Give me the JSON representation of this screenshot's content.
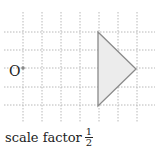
{
  "diagram": {
    "grid": {
      "vertical_x": [
        23,
        42,
        61,
        80,
        99,
        118,
        137
      ],
      "horizontal_y": [
        32,
        50,
        68,
        87,
        105
      ],
      "color": "#b8b8b8"
    },
    "center": {
      "label": "O",
      "x": 23,
      "y": 68
    },
    "triangle": {
      "points": "98,32 136,69 98,106",
      "fill": "#ececec",
      "stroke": "#8a8a8a"
    },
    "caption": {
      "text": "scale factor",
      "fraction_numerator": "1",
      "fraction_denominator": "2"
    }
  }
}
